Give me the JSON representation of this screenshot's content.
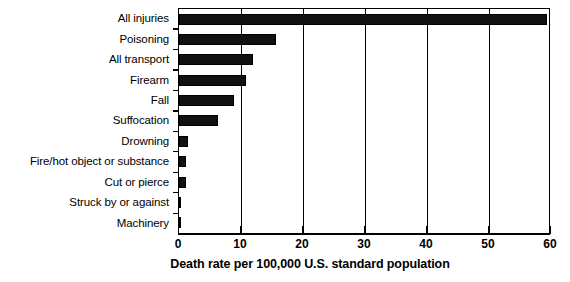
{
  "chart_data": {
    "type": "bar",
    "orientation": "horizontal",
    "title": "",
    "xlabel": "Death rate per 100,000 U.S. standard population",
    "ylabel": "",
    "xlim": [
      0,
      60
    ],
    "xticks": [
      0,
      10,
      20,
      30,
      40,
      50,
      60
    ],
    "xtick_labels": [
      "0",
      "10",
      "20",
      "30",
      "40",
      "50",
      "60"
    ],
    "grid": true,
    "grid_axis": "x",
    "legend": false,
    "bar_color": "#111111",
    "categories": [
      "All injuries",
      "Poisoning",
      "All transport",
      "Firearm",
      "Fall",
      "Suffocation",
      "Drowning",
      "Fire/hot object or substance",
      "Cut or pierce",
      "Struck by or against",
      "Machinery"
    ],
    "values": [
      59.4,
      15.6,
      11.9,
      10.8,
      8.9,
      6.3,
      1.5,
      1.2,
      1.1,
      0.4,
      0.3
    ]
  }
}
